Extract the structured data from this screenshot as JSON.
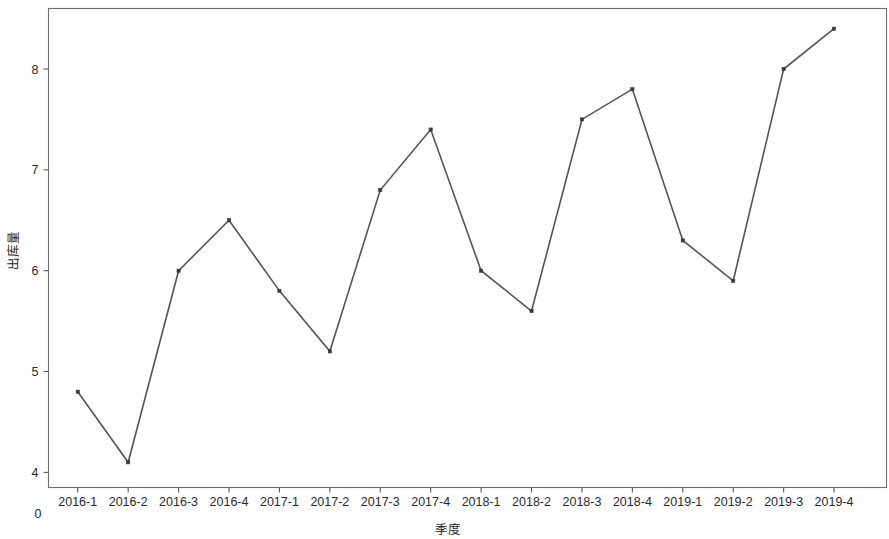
{
  "chart_data": {
    "type": "line",
    "title": "",
    "subtitle": "",
    "xlabel": "季度",
    "ylabel": "出库量",
    "categories": [
      "2016-1",
      "2016-2",
      "2016-3",
      "2016-4",
      "2017-1",
      "2017-2",
      "2017-3",
      "2017-4",
      "2018-1",
      "2018-2",
      "2018-3",
      "2018-4",
      "2019-1",
      "2019-2",
      "2019-3",
      "2019-4"
    ],
    "values": [
      4.8,
      4.1,
      6.0,
      6.5,
      5.8,
      5.2,
      6.8,
      7.4,
      6.0,
      5.6,
      7.5,
      7.8,
      6.3,
      5.9,
      8.0,
      8.4
    ],
    "series": [
      {
        "name": "出库量",
        "values": [
          4.8,
          4.1,
          6.0,
          6.5,
          5.8,
          5.2,
          6.8,
          7.4,
          6.0,
          5.6,
          7.5,
          7.8,
          6.3,
          5.9,
          8.0,
          8.4
        ]
      }
    ],
    "y_ticks": [
      4,
      5,
      6,
      7,
      8
    ],
    "y_tick_labels": [
      "4",
      "5",
      "6",
      "7",
      "8"
    ],
    "ylim": [
      3.85,
      8.6
    ],
    "x_origin_label": "0",
    "grid": false,
    "legend": false,
    "legend_position": "none",
    "marker": "square",
    "line_color": "#555555",
    "marker_color": "#3a3a3a",
    "frame_color": "#6e6e6e",
    "background_color": "#ffffff"
  }
}
